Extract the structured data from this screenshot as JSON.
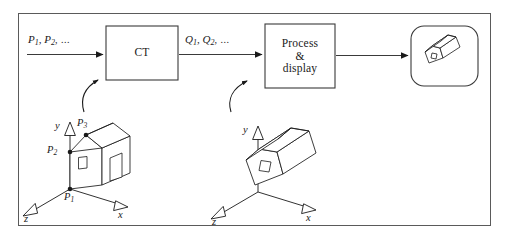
{
  "figure": {
    "border_color": "#5a5a5a",
    "stroke_color": "#1a1a1a",
    "background": "#ffffff"
  },
  "flow": {
    "input_label": {
      "base1": "P",
      "sub1": "1",
      "sep": ", ",
      "base2": "P",
      "sub2": "2",
      "dots": ", ..."
    },
    "input_text": "P1, P2, ...",
    "output_label": {
      "base1": "Q",
      "sub1": "1",
      "sep": ", ",
      "base2": "Q",
      "sub2": "2",
      "dots": ", ..."
    },
    "output_text": "Q1, Q2, ..."
  },
  "blocks": [
    {
      "id": "ct",
      "label": "CT",
      "shape": "rectangle"
    },
    {
      "id": "process-display",
      "label": "Process\n&\ndisplay",
      "line1": "Process",
      "line2": "&",
      "line3": "display",
      "shape": "rectangle"
    },
    {
      "id": "display-screen",
      "label": "",
      "shape": "rounded-rectangle"
    }
  ],
  "scenes": {
    "source": {
      "name": "source-house-scene",
      "axes": [
        {
          "name": "y",
          "label": "y"
        },
        {
          "name": "x",
          "label": "x"
        },
        {
          "name": "z",
          "label": "z"
        }
      ],
      "points": [
        {
          "name": "P1",
          "base": "P",
          "sub": "1"
        },
        {
          "name": "P2",
          "base": "P",
          "sub": "2"
        },
        {
          "name": "P3",
          "base": "P",
          "sub": "3"
        }
      ],
      "object": "house"
    },
    "transformed": {
      "name": "transformed-house-scene",
      "axes": [
        {
          "name": "y",
          "label": "y"
        },
        {
          "name": "x",
          "label": "x"
        },
        {
          "name": "z",
          "label": "z"
        }
      ],
      "points": [],
      "object": "house-rotated"
    }
  }
}
